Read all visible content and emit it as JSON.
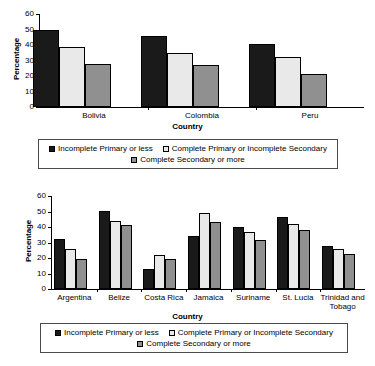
{
  "series_names": [
    "Incomplete Primary or less",
    "Complete Primary or Incomplete Secondary",
    "Complete Secondary or more"
  ],
  "series_colors": [
    "#1a1a1a",
    "#e9e9e9",
    "#909090"
  ],
  "axis": {
    "ylabel": "Percentage",
    "xlabel": "Country",
    "yticks": [
      "0",
      "10",
      "20",
      "30",
      "40",
      "50",
      "60"
    ]
  },
  "chart_data": [
    {
      "type": "bar",
      "title": "",
      "xlabel": "Country",
      "ylabel": "Percentage",
      "ylim": [
        0,
        60
      ],
      "yticks": [
        0,
        10,
        20,
        30,
        40,
        50,
        60
      ],
      "grid": false,
      "legend_position": "bottom",
      "categories": [
        "Bolivia",
        "Colombia",
        "Peru"
      ],
      "series": [
        {
          "name": "Incomplete Primary or less",
          "values": [
            50.0,
            45.5,
            40.5
          ]
        },
        {
          "name": "Complete Primary or Incomplete Secondary",
          "values": [
            39.0,
            35.0,
            32.5
          ]
        },
        {
          "name": "Complete Secondary or more",
          "values": [
            28.0,
            27.0,
            21.5
          ]
        }
      ]
    },
    {
      "type": "bar",
      "title": "",
      "xlabel": "Country",
      "ylabel": "Percentage",
      "ylim": [
        0,
        60
      ],
      "yticks": [
        0,
        10,
        20,
        30,
        40,
        50,
        60
      ],
      "grid": false,
      "legend_position": "bottom",
      "categories": [
        "Argentina",
        "Belize",
        "Costa Rica",
        "Jamaica",
        "Suriname",
        "St. Lucia",
        "Trinidad and\nTobago"
      ],
      "series": [
        {
          "name": "Incomplete Primary or less",
          "values": [
            32.5,
            50.5,
            13.0,
            34.0,
            40.0,
            46.5,
            28.0
          ]
        },
        {
          "name": "Complete Primary or Incomplete Secondary",
          "values": [
            25.5,
            44.0,
            22.0,
            49.0,
            36.5,
            42.0,
            25.5
          ]
        },
        {
          "name": "Complete Secondary or more",
          "values": [
            19.5,
            41.0,
            19.5,
            43.0,
            31.5,
            38.0,
            22.5
          ]
        }
      ]
    }
  ]
}
